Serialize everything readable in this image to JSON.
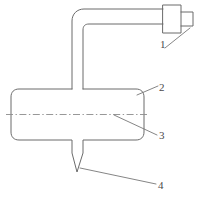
{
  "figure": {
    "type": "patent-line-drawing",
    "background_color": "#ffffff",
    "line_color": "#6b6b6b",
    "centerline_color": "#8c8c8c",
    "label_color": "#4a4a4a",
    "callouts": [
      {
        "id": "1",
        "label": "1",
        "refers_to": "hub-connector"
      },
      {
        "id": "2",
        "label": "2",
        "refers_to": "cross-body"
      },
      {
        "id": "3",
        "label": "3",
        "refers_to": "axis-centerline"
      },
      {
        "id": "4",
        "label": "4",
        "refers_to": "pointed-tip"
      }
    ]
  }
}
